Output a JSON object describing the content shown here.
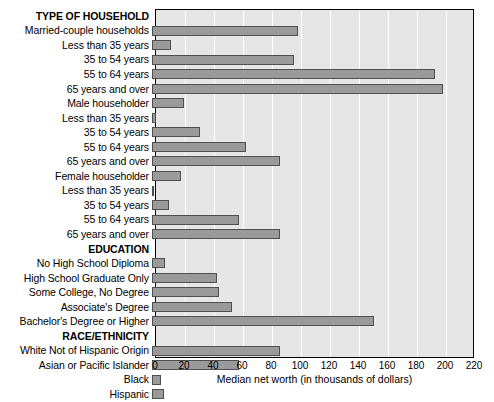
{
  "chart_data": {
    "type": "bar",
    "orientation": "horizontal",
    "title": "",
    "xlabel": "Median net worth (in thousands of dollars)",
    "ylabel": "",
    "xlim": [
      0,
      220
    ],
    "xticks": [
      0,
      20,
      40,
      60,
      80,
      100,
      120,
      140,
      160,
      180,
      200,
      220
    ],
    "grid": true,
    "legend": "none",
    "bar_color": "#9a9a9a",
    "bar_edge_color": "#4f4f4f",
    "plot_background": "#e6e6e6",
    "gridline_color": "#ffffff",
    "categories": [
      "TYPE OF HOUSEHOLD",
      "Married-couple households",
      "Less than 35 years",
      "35 to 54 years",
      "55 to 64 years",
      "65 years and over",
      "Male householder",
      "Less than 35 years",
      "35 to 54 years",
      "55 to 64 years",
      "65 years and over",
      "Female householder",
      "Less than 35 years",
      "35 to 54 years",
      "55 to 64 years",
      "65 years and over",
      "EDUCATION",
      "No High School Diploma",
      "High School Graduate Only",
      "Some College, No Degree",
      "Associate's Degree",
      "Bachelor's Degree or Higher",
      "RACE/ETHNICITY",
      "White Not of Hispanic Origin",
      "Asian or Pacific Islander",
      "Black",
      "Hispanic"
    ],
    "values": [
      null,
      101,
      13,
      98,
      195,
      201,
      22,
      3,
      33,
      65,
      88,
      20,
      1,
      12,
      60,
      88,
      null,
      9,
      45,
      46,
      55,
      153,
      null,
      88,
      60,
      6,
      8
    ],
    "section_headers": [
      "TYPE OF HOUSEHOLD",
      "EDUCATION",
      "RACE/ETHNICITY"
    ],
    "rows": [
      {
        "label": "TYPE OF HOUSEHOLD",
        "value": null,
        "header": true
      },
      {
        "label": "Married-couple households",
        "value": 101,
        "header": false
      },
      {
        "label": "Less than 35 years",
        "value": 13,
        "header": false
      },
      {
        "label": "35 to 54 years",
        "value": 98,
        "header": false
      },
      {
        "label": "55 to 64 years",
        "value": 195,
        "header": false
      },
      {
        "label": "65 years and over",
        "value": 201,
        "header": false
      },
      {
        "label": "Male householder",
        "value": 22,
        "header": false
      },
      {
        "label": "Less than 35 years",
        "value": 3,
        "header": false
      },
      {
        "label": "35 to 54 years",
        "value": 33,
        "header": false
      },
      {
        "label": "55 to 64 years",
        "value": 65,
        "header": false
      },
      {
        "label": "65 years and over",
        "value": 88,
        "header": false
      },
      {
        "label": "Female householder",
        "value": 20,
        "header": false
      },
      {
        "label": "Less than 35 years",
        "value": 1,
        "header": false
      },
      {
        "label": "35 to 54 years",
        "value": 12,
        "header": false
      },
      {
        "label": "55 to 64 years",
        "value": 60,
        "header": false
      },
      {
        "label": "65 years and over",
        "value": 88,
        "header": false
      },
      {
        "label": "EDUCATION",
        "value": null,
        "header": true
      },
      {
        "label": "No High School Diploma",
        "value": 9,
        "header": false
      },
      {
        "label": "High School Graduate Only",
        "value": 45,
        "header": false
      },
      {
        "label": "Some College, No Degree",
        "value": 46,
        "header": false
      },
      {
        "label": "Associate's Degree",
        "value": 55,
        "header": false
      },
      {
        "label": "Bachelor's Degree or Higher",
        "value": 153,
        "header": false
      },
      {
        "label": "RACE/ETHNICITY",
        "value": null,
        "header": true
      },
      {
        "label": "White Not of Hispanic Origin",
        "value": 88,
        "header": false
      },
      {
        "label": "Asian or Pacific Islander",
        "value": 60,
        "header": false
      },
      {
        "label": "Black",
        "value": 6,
        "header": false
      },
      {
        "label": "Hispanic",
        "value": 8,
        "header": false
      }
    ]
  }
}
